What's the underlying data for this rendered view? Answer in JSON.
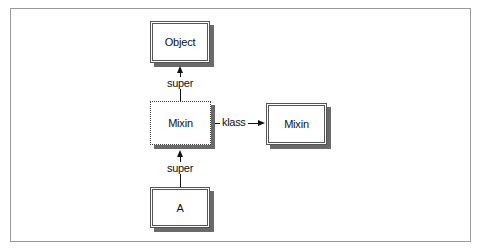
{
  "diagram": {
    "nodes": [
      {
        "id": "object",
        "label": "Object",
        "style": "double-border"
      },
      {
        "id": "mixin-proxy",
        "label": "Mixin",
        "style": "dotted-border"
      },
      {
        "id": "mixin-module",
        "label": "Mixin",
        "style": "double-border"
      },
      {
        "id": "a",
        "label": "A",
        "style": "double-border"
      }
    ],
    "edges": [
      {
        "from": "mixin-proxy",
        "to": "object",
        "label": "super"
      },
      {
        "from": "mixin-proxy",
        "to": "mixin-module",
        "label": "klass"
      },
      {
        "from": "a",
        "to": "mixin-proxy",
        "label": "super"
      }
    ]
  }
}
